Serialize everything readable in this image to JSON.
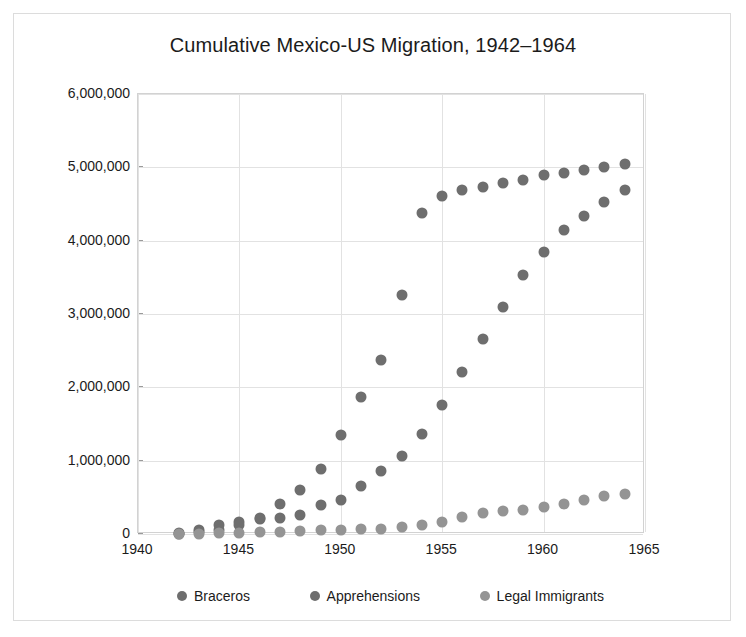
{
  "card": {
    "title": "Cumulative Mexico-US Migration, 1942–1964"
  },
  "chart_data": {
    "type": "scatter",
    "title": "Cumulative Mexico-US Migration, 1942–1964",
    "xlabel": "",
    "ylabel": "",
    "xlim": [
      1940,
      1965
    ],
    "ylim": [
      0,
      6000000
    ],
    "xticks": [
      "1940",
      "1945",
      "1950",
      "1955",
      "1960",
      "1965"
    ],
    "xtick_values": [
      1940,
      1945,
      1950,
      1955,
      1960,
      1965
    ],
    "yticks": [
      "0",
      "1,000,000",
      "2,000,000",
      "3,000,000",
      "4,000,000",
      "5,000,000",
      "6,000,000"
    ],
    "ytick_values": [
      0,
      1000000,
      2000000,
      3000000,
      4000000,
      5000000,
      6000000
    ],
    "grid": true,
    "legend_position": "bottom",
    "x": [
      1942,
      1943,
      1944,
      1945,
      1946,
      1947,
      1948,
      1949,
      1950,
      1951,
      1952,
      1953,
      1954,
      1955,
      1956,
      1957,
      1958,
      1959,
      1960,
      1961,
      1962,
      1963,
      1964
    ],
    "series": [
      {
        "name": "Braceros",
        "color": "#6e6e6e",
        "values": [
          4000,
          56000,
          118000,
          169000,
          201000,
          221000,
          256000,
          399000,
          466000,
          658000,
          855000,
          1057000,
          1366000,
          1764000,
          2210000,
          2656000,
          3090000,
          3531000,
          3847000,
          4141000,
          4336000,
          4522000,
          4687000
        ]
      },
      {
        "name": "Apprehensions",
        "color": "#6e6e6e",
        "values": [
          11000,
          22000,
          51000,
          120000,
          212000,
          406000,
          598000,
          887000,
          1352000,
          1862000,
          2379000,
          3264000,
          4372000,
          4614000,
          4694000,
          4738000,
          4784000,
          4829000,
          4899000,
          4928000,
          4958000,
          5001000,
          5044000
        ]
      },
      {
        "name": "Legal Immigrants",
        "color": "#949494",
        "values": [
          2400,
          6000,
          12000,
          19000,
          26000,
          34000,
          42000,
          50000,
          57000,
          64000,
          73000,
          91000,
          123000,
          167000,
          232000,
          281000,
          307000,
          333000,
          365000,
          406000,
          461000,
          516000,
          549000
        ]
      }
    ]
  },
  "legend": {
    "items": [
      {
        "label": "Braceros",
        "color": "#6e6e6e"
      },
      {
        "label": "Apprehensions",
        "color": "#6e6e6e"
      },
      {
        "label": "Legal Immigrants",
        "color": "#949494"
      }
    ]
  }
}
